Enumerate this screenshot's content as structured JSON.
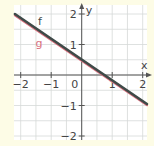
{
  "chart_data": {
    "type": "line",
    "title": "",
    "xlabel": "x",
    "ylabel": "y",
    "xlim": [
      -2.2,
      2.15
    ],
    "ylim": [
      -2.15,
      2.3
    ],
    "x_ticks": [
      -2,
      -1,
      0,
      1,
      2
    ],
    "y_ticks": [
      -2,
      -1,
      1,
      2
    ],
    "x_tick_labels": [
      "−2",
      "−1",
      "0",
      "1",
      "2"
    ],
    "y_tick_labels": [
      "−2",
      "−1",
      "1",
      "2"
    ],
    "grid": true,
    "grid_step": 0.5,
    "series": [
      {
        "name": "f",
        "color": "#3f4a48",
        "x": [
          -2.19,
          2.14
        ],
        "y": [
          2.0,
          -0.95
        ],
        "label_pos": [
          -1.37,
          1.77
        ]
      },
      {
        "name": "g",
        "color": "#d9707e",
        "x": [
          -2.19,
          2.14
        ],
        "y": [
          1.96,
          -0.99
        ],
        "label_pos": [
          -1.4,
          1.05
        ]
      }
    ]
  },
  "colors": {
    "background": "#fdfce6",
    "plot_area": "#ffffff",
    "grid": "#d6d9d8",
    "axis": "#555555"
  }
}
